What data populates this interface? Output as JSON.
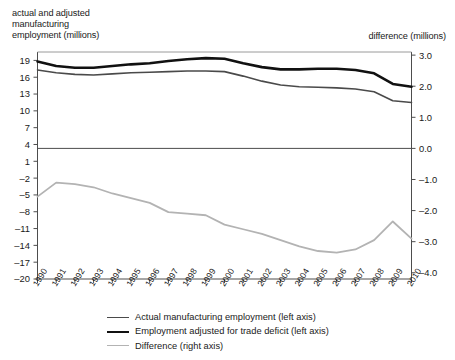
{
  "titles": {
    "left_axis_title": "actual and adjusted\nmanufacturing\nemployment (millions)",
    "right_axis_title": "difference (millions)"
  },
  "legend": {
    "items": [
      {
        "label": "Actual manufacturing employment (left axis)",
        "color": "#4a4a4a",
        "style": "thin-dark-gray"
      },
      {
        "label": "Employment adjusted for trade deficit (left axis)",
        "color": "#111111",
        "style": "thick-black"
      },
      {
        "label": "Difference (right axis)",
        "color": "#b3b3b3",
        "style": "light-gray"
      }
    ]
  },
  "chart_data": {
    "type": "line",
    "title": "",
    "xlabel": "",
    "ylabel": "actual and adjusted manufacturing employment (millions)",
    "y2label": "difference (millions)",
    "grid": false,
    "legend_position": "bottom",
    "x": [
      1990,
      1991,
      1992,
      1993,
      1994,
      1995,
      1996,
      1997,
      1998,
      1999,
      2000,
      2001,
      2002,
      2003,
      2004,
      2005,
      2006,
      2007,
      2008,
      2009,
      2010
    ],
    "xtick_labels": [
      "1990",
      "1991",
      "1992",
      "1993",
      "1994",
      "1995",
      "1996",
      "1997",
      "1998",
      "1999",
      "2000",
      "2001",
      "2002",
      "2003",
      "2004",
      "2005",
      "2006",
      "2007",
      "2008",
      "2009",
      "2010"
    ],
    "ylim": [
      -20,
      20.5
    ],
    "ytick_labels": [
      "19",
      "16",
      "13",
      "10",
      "7",
      "4",
      "1",
      "-2",
      "-5",
      "-8",
      "-11",
      "-14",
      "-17",
      "-20"
    ],
    "yticks": [
      19,
      16,
      13,
      10,
      7,
      4,
      1,
      -2,
      -5,
      -8,
      -11,
      -14,
      -17,
      -20
    ],
    "y2lim": [
      -4.2,
      3.1
    ],
    "y2tick_labels": [
      "3.0",
      "2.0",
      "1.0",
      "0.0",
      "-1.0",
      "-2.0",
      "-3.0",
      "-4.0"
    ],
    "y2ticks": [
      3.0,
      2.0,
      1.0,
      0.0,
      -1.0,
      -2.0,
      -3.0,
      -4.0
    ],
    "zero_line_value": 0.0,
    "series": [
      {
        "name": "Actual manufacturing employment (left axis)",
        "axis": "left",
        "color": "#4a4a4a",
        "width": 1.6,
        "values": [
          17.3,
          16.8,
          16.5,
          16.4,
          16.6,
          16.8,
          16.9,
          17.0,
          17.1,
          17.1,
          17.0,
          16.2,
          15.3,
          14.6,
          14.3,
          14.2,
          14.1,
          13.9,
          13.4,
          11.8,
          11.5
        ]
      },
      {
        "name": "Employment adjusted for trade deficit (left axis)",
        "axis": "left",
        "color": "#111111",
        "width": 2.6,
        "values": [
          18.8,
          18.0,
          17.7,
          17.7,
          18.0,
          18.3,
          18.5,
          18.9,
          19.2,
          19.4,
          19.3,
          18.5,
          17.8,
          17.4,
          17.4,
          17.5,
          17.5,
          17.3,
          16.7,
          14.8,
          14.3
        ]
      },
      {
        "name": "Difference (right axis)",
        "axis": "right",
        "color": "#b3b3b3",
        "width": 1.8,
        "values": [
          -1.55,
          -1.1,
          -1.15,
          -1.25,
          -1.45,
          -1.6,
          -1.75,
          -2.05,
          -2.1,
          -2.15,
          -2.45,
          -2.6,
          -2.75,
          -2.95,
          -3.15,
          -3.3,
          -3.35,
          -3.25,
          -2.95,
          -2.35,
          -2.9
        ]
      }
    ]
  }
}
